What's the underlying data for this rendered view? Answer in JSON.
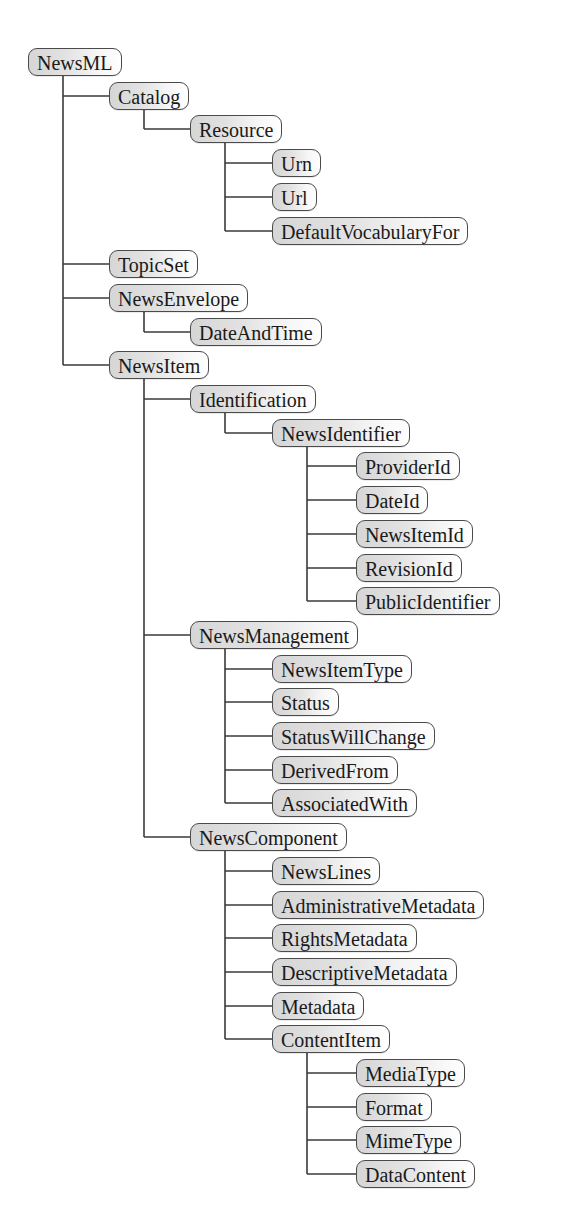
{
  "diagram": {
    "colors": {
      "line": "#3a3a3a",
      "box_border": "#4a4a4a",
      "box_fill_left": "#d6d6d6",
      "box_fill_right": "#ffffff",
      "text": "#1a1a1a",
      "background": "#ffffff"
    },
    "nodes": [
      {
        "label": "NewsML",
        "level": 0
      },
      {
        "label": "Catalog",
        "level": 1
      },
      {
        "label": "Resource",
        "level": 2
      },
      {
        "label": "Urn",
        "level": 3
      },
      {
        "label": "Url",
        "level": 3
      },
      {
        "label": "DefaultVocabularyFor",
        "level": 3
      },
      {
        "label": "TopicSet",
        "level": 1
      },
      {
        "label": "NewsEnvelope",
        "level": 1
      },
      {
        "label": "DateAndTime",
        "level": 2
      },
      {
        "label": "NewsItem",
        "level": 1
      },
      {
        "label": "Identification",
        "level": 2
      },
      {
        "label": "NewsIdentifier",
        "level": 3
      },
      {
        "label": "ProviderId",
        "level": 4
      },
      {
        "label": "DateId",
        "level": 4
      },
      {
        "label": "NewsItemId",
        "level": 4
      },
      {
        "label": "RevisionId",
        "level": 4
      },
      {
        "label": "PublicIdentifier",
        "level": 4
      },
      {
        "label": "NewsManagement",
        "level": 2
      },
      {
        "label": "NewsItemType",
        "level": 3
      },
      {
        "label": "Status",
        "level": 3
      },
      {
        "label": "StatusWillChange",
        "level": 3
      },
      {
        "label": "DerivedFrom",
        "level": 3
      },
      {
        "label": "AssociatedWith",
        "level": 3
      },
      {
        "label": "NewsComponent",
        "level": 2
      },
      {
        "label": "NewsLines",
        "level": 3
      },
      {
        "label": "AdministrativeMetadata",
        "level": 3
      },
      {
        "label": "RightsMetadata",
        "level": 3
      },
      {
        "label": "DescriptiveMetadata",
        "level": 3
      },
      {
        "label": "Metadata",
        "level": 3
      },
      {
        "label": "ContentItem",
        "level": 3
      },
      {
        "label": "MediaType",
        "level": 4
      },
      {
        "label": "Format",
        "level": 4
      },
      {
        "label": "MimeType",
        "level": 4
      },
      {
        "label": "DataContent",
        "level": 4
      }
    ]
  }
}
